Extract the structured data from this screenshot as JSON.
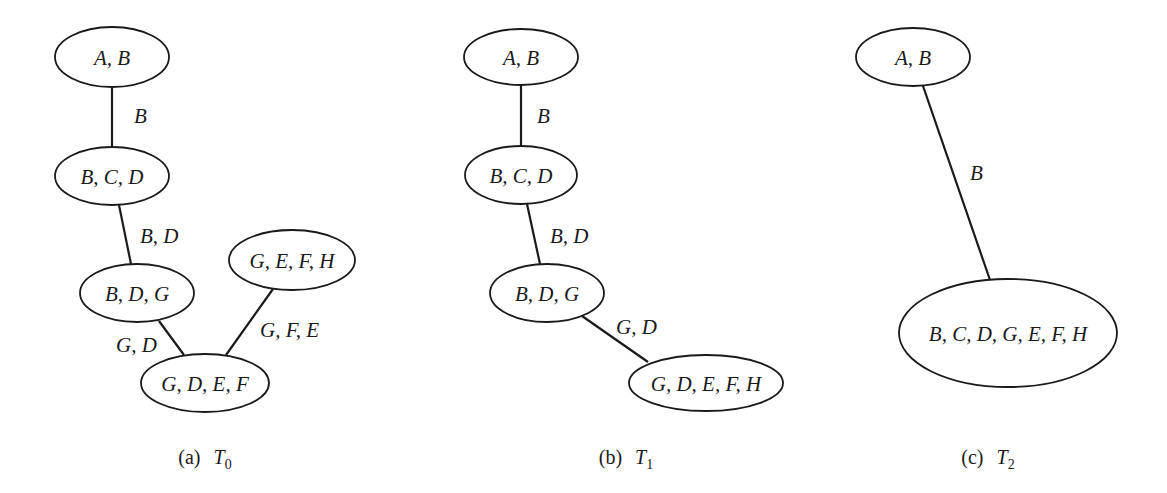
{
  "figure": {
    "panels": [
      {
        "id": "T0",
        "caption_prefix": "(a)",
        "caption_symbol": "T",
        "caption_subscript": "0",
        "nodes": [
          {
            "label": "A, B",
            "cx": 112,
            "cy": 57,
            "rx": 57,
            "ry": 30
          },
          {
            "label": "B, C, D",
            "cx": 112,
            "cy": 176,
            "rx": 57,
            "ry": 29
          },
          {
            "label": "B, D, G",
            "cx": 137,
            "cy": 293,
            "rx": 57,
            "ry": 29
          },
          {
            "label": "G, E, F, H",
            "cx": 292,
            "cy": 260,
            "rx": 63,
            "ry": 30
          },
          {
            "label": "G, D, E, F",
            "cx": 205,
            "cy": 383,
            "rx": 64,
            "ry": 29
          }
        ],
        "edges": [
          {
            "from": "A, B",
            "to": "B, C, D",
            "label": "B",
            "x1": 112,
            "y1": 87,
            "x2": 112,
            "y2": 147,
            "lx": 134,
            "ly": 123
          },
          {
            "from": "B, C, D",
            "to": "B, D, G",
            "label": "B, D",
            "x1": 119,
            "y1": 205,
            "x2": 131,
            "y2": 264,
            "lx": 140,
            "ly": 243
          },
          {
            "from": "B, D, G",
            "to": "G, D, E, F",
            "label": "G, D",
            "x1": 159,
            "y1": 321,
            "x2": 184,
            "y2": 355,
            "lx": 116,
            "ly": 352
          },
          {
            "from": "G, E, F, H",
            "to": "G, D, E, F",
            "label": "G, F, E",
            "x1": 273,
            "y1": 289,
            "x2": 226,
            "y2": 355,
            "lx": 260,
            "ly": 337
          }
        ]
      },
      {
        "id": "T1",
        "caption_prefix": "(b)",
        "caption_symbol": "T",
        "caption_subscript": "1",
        "nodes": [
          {
            "label": "A, B",
            "cx": 521,
            "cy": 57,
            "rx": 57,
            "ry": 28
          },
          {
            "label": "B, C, D",
            "cx": 521,
            "cy": 175,
            "rx": 56,
            "ry": 29
          },
          {
            "label": "B, D, G",
            "cx": 547,
            "cy": 293,
            "rx": 57,
            "ry": 29
          },
          {
            "label": "G, D, E, F, H",
            "cx": 706,
            "cy": 383,
            "rx": 77,
            "ry": 28
          }
        ],
        "edges": [
          {
            "from": "A, B",
            "to": "B, C, D",
            "label": "B",
            "x1": 521,
            "y1": 85,
            "x2": 521,
            "y2": 146,
            "lx": 537,
            "ly": 123
          },
          {
            "from": "B, C, D",
            "to": "B, D, G",
            "label": "B, D",
            "x1": 527,
            "y1": 204,
            "x2": 540,
            "y2": 264,
            "lx": 550,
            "ly": 243
          },
          {
            "from": "B, D, G",
            "to": "G, D, E, F, H",
            "label": "G, D",
            "x1": 582,
            "y1": 316,
            "x2": 648,
            "y2": 362,
            "lx": 616,
            "ly": 334
          }
        ]
      },
      {
        "id": "T2",
        "caption_prefix": "(c)",
        "caption_symbol": "T",
        "caption_subscript": "2",
        "nodes": [
          {
            "label": "A, B",
            "cx": 913,
            "cy": 57,
            "rx": 57,
            "ry": 29
          },
          {
            "label": "B, C, D, G, E, F, H",
            "cx": 1008,
            "cy": 333,
            "rx": 109,
            "ry": 54
          }
        ],
        "edges": [
          {
            "from": "A, B",
            "to": "B, C, D, G, E, F, H",
            "label": "B",
            "x1": 923,
            "y1": 86,
            "x2": 990,
            "y2": 280,
            "lx": 970,
            "ly": 180
          }
        ]
      }
    ],
    "colors": {
      "stroke": "#1a1a1a",
      "background": "#ffffff"
    }
  }
}
